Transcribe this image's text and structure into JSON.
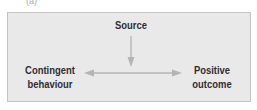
{
  "diagram": {
    "top_fragment": "(a)",
    "nodes": {
      "source": "Source",
      "left": [
        "Contingent",
        "behaviour"
      ],
      "right": [
        "Positive",
        "outcome"
      ]
    },
    "colors": {
      "box_fill": "#e9e9e9",
      "box_border": "#c4c4c4",
      "arrow": "#b4b4b4",
      "text": "#2f2f2f"
    }
  }
}
